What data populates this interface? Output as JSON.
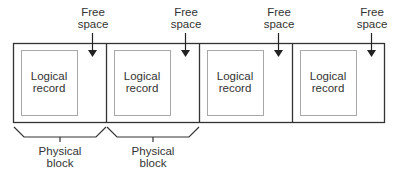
{
  "diagram": {
    "type": "blocked-records-layout",
    "colors": {
      "block_border": "#333333",
      "record_border": "#a8a8a8",
      "text": "#333333"
    },
    "free_space_label_line1": "Free",
    "free_space_label_line2": "space",
    "blocks": [
      {
        "record_line1": "Logical",
        "record_line2": "record",
        "free_line1": "Free",
        "free_line2": "space"
      },
      {
        "record_line1": "Logical",
        "record_line2": "record",
        "free_line1": "Free",
        "free_line2": "space"
      },
      {
        "record_line1": "Logical",
        "record_line2": "record",
        "free_line1": "Free",
        "free_line2": "space"
      },
      {
        "record_line1": "Logical",
        "record_line2": "record",
        "free_line1": "Free",
        "free_line2": "space"
      }
    ],
    "braces": [
      {
        "line1": "Physical",
        "line2": "block"
      },
      {
        "line1": "Physical",
        "line2": "block"
      }
    ],
    "caption": "(caption cut off at bottom edge)"
  }
}
